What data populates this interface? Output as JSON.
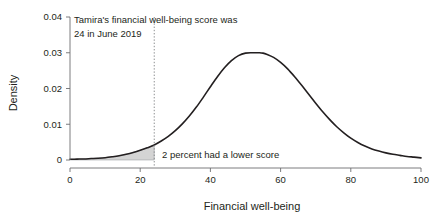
{
  "chart_data": {
    "type": "line",
    "title": "",
    "subtitle": "",
    "xlabel": "Financial well-being",
    "ylabel": "Density",
    "xlim": [
      0,
      100
    ],
    "ylim": [
      0,
      0.04
    ],
    "grid": false,
    "legend": "none",
    "x_ticks": [
      "0",
      "20",
      "40",
      "60",
      "80",
      "100"
    ],
    "x_tick_values": [
      0,
      20,
      40,
      60,
      80,
      100
    ],
    "y_ticks": [
      "0",
      "0.01",
      "0.02",
      "0.03",
      "0.04"
    ],
    "y_tick_values": [
      0,
      0.01,
      0.02,
      0.03,
      0.04
    ],
    "series": [
      {
        "name": "Density of financial well-being scores",
        "x": [
          0,
          2,
          4,
          6,
          8,
          10,
          12,
          14,
          16,
          18,
          20,
          22,
          24,
          26,
          28,
          30,
          32,
          34,
          36,
          38,
          40,
          42,
          44,
          46,
          48,
          50,
          52,
          54,
          55,
          56,
          58,
          60,
          62,
          64,
          66,
          68,
          70,
          72,
          74,
          76,
          78,
          80,
          82,
          84,
          86,
          88,
          90,
          92,
          94,
          96,
          98,
          100
        ],
        "values": [
          0.0002,
          0.00025,
          0.0003,
          0.0004,
          0.0005,
          0.00065,
          0.0009,
          0.0012,
          0.0016,
          0.0021,
          0.0027,
          0.0034,
          0.0042,
          0.0053,
          0.0066,
          0.0082,
          0.0101,
          0.0123,
          0.0148,
          0.0176,
          0.0205,
          0.0233,
          0.0258,
          0.0278,
          0.0292,
          0.0299,
          0.03,
          0.03,
          0.0299,
          0.0296,
          0.0287,
          0.0273,
          0.0255,
          0.0233,
          0.0209,
          0.0184,
          0.0159,
          0.0135,
          0.0113,
          0.0093,
          0.0076,
          0.0061,
          0.0049,
          0.0039,
          0.0031,
          0.0025,
          0.002,
          0.0016,
          0.0013,
          0.001,
          0.0008,
          0.0006
        ]
      }
    ],
    "annotations": [
      {
        "name": "tamira-score-note",
        "text_line_1": "Tamira's financial well-being score was",
        "text_line_2": "24 in June 2019"
      },
      {
        "name": "lower-score-note",
        "text": "2 percent had a lower score"
      }
    ],
    "threshold": {
      "name": "tamira-score-threshold",
      "value": 24,
      "style": "dotted"
    },
    "shaded_region": {
      "name": "lower-tail-shading",
      "x_from": 0,
      "x_to": 24,
      "percent_label": "2 percent",
      "fill_color": "#d4d4d4"
    },
    "colors": {
      "curve": "#231f20",
      "axis": "#6d6e71",
      "shading": "#d4d4d4",
      "threshold": "#808285",
      "text": "#231f20"
    }
  }
}
